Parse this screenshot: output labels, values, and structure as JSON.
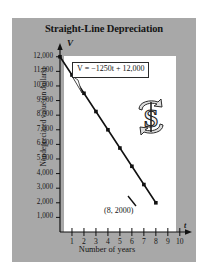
{
  "figure": {
    "title": "Straight-Line Depreciation",
    "panel_color": "#a8a8a8",
    "plot_background": "#ffffff",
    "line_color": "#111111",
    "icon_name": "dollar-sign-recycle-icon"
  },
  "annotations": {
    "equation_label": "V = −1250t + 12,000",
    "point_label": "(8, 2000)",
    "v_axis_name": "V",
    "t_axis_name": "t"
  },
  "chart_data": {
    "type": "line",
    "title": "Straight-Line Depreciation",
    "xlabel": "Number of years",
    "ylabel": "Nondepreciated value (in dollars)",
    "xlim": [
      0,
      10.6
    ],
    "ylim": [
      0,
      12600
    ],
    "grid": false,
    "legend": "none",
    "x_ticks": [
      1,
      2,
      3,
      4,
      5,
      6,
      7,
      8,
      9,
      10
    ],
    "x_tick_labels": [
      "1",
      "2",
      "3",
      "4",
      "5",
      "6",
      "7",
      "8",
      "9",
      "10"
    ],
    "y_ticks": [
      1000,
      2000,
      3000,
      4000,
      5000,
      6000,
      7000,
      8000,
      9000,
      10000,
      11000,
      12000
    ],
    "y_tick_labels": [
      "12,000",
      "11,000",
      "10,000",
      "9,000",
      "8,000",
      "7,000",
      "6,000",
      "5,000",
      "4,000",
      "3,000",
      "2,000",
      "1,000"
    ],
    "equation": "V = -1250t + 12,000",
    "series": [
      {
        "name": "Nondepreciated value",
        "x": [
          0,
          1,
          2,
          3,
          4,
          5,
          6,
          7,
          8
        ],
        "values": [
          12000,
          10750,
          9500,
          8250,
          7000,
          5750,
          4500,
          3250,
          2000
        ],
        "marker": "square",
        "annotated_point": [
          8,
          2000
        ]
      }
    ]
  }
}
